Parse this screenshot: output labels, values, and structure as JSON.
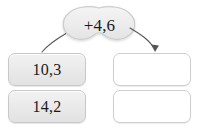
{
  "worksheet": {
    "type": "function-machine",
    "operation": {
      "label": "+4,6",
      "shape": "cloud-blob"
    },
    "arrows": [
      {
        "name": "arrow-to-input",
        "direction": "down-left",
        "has_arrowhead": false
      },
      {
        "name": "arrow-to-output",
        "direction": "down-right",
        "has_arrowhead": true
      }
    ],
    "input_column": {
      "boxes": [
        {
          "value": "10,3",
          "filled": true
        },
        {
          "value": "14,2",
          "filled": true
        }
      ]
    },
    "output_column": {
      "boxes": [
        {
          "value": "",
          "filled": false
        },
        {
          "value": "",
          "filled": false
        }
      ]
    },
    "colors": {
      "background": "#ffffff",
      "filled_box_fill": "#e9e9e9",
      "filled_box_border": "#c8c8c8",
      "empty_box_fill": "#ffffff",
      "empty_box_border": "#cfcfcf",
      "blob_fill": "#ececec",
      "blob_border": "#cccccc",
      "arrow_stroke": "#555555",
      "text": "#1a1a1a"
    }
  }
}
